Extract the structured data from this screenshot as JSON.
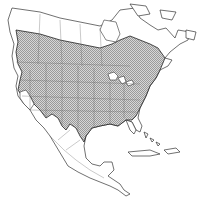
{
  "map": {
    "region": "North America",
    "type": "species range map",
    "legend": [],
    "colors": {
      "land": "#ffffff",
      "outline": "#333333",
      "range_hatch": "#9a9a9a",
      "borders": "#666666"
    },
    "range_description": "Hatched distribution covering southern Canada and most of the contiguous United States, extending into northeastern Mexico; excludes arctic Canada, Alaska, coastal California/southwestern deserts, Florida peninsula, most of Mexico, Central America and the Caribbean."
  }
}
